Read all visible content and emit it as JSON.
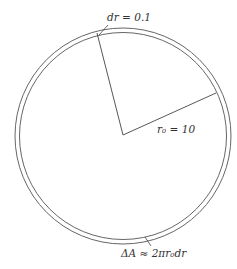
{
  "diagram": {
    "labels": {
      "dr": "dr = 0.1",
      "r0": "r₀ = 10",
      "area": "ΔA ≈ 2πr₀dr"
    },
    "colors": {
      "stroke": "#555555",
      "text": "#333333",
      "background": "#ffffff"
    }
  }
}
